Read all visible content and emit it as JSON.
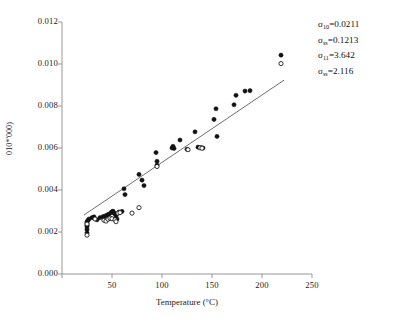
{
  "chart_data": {
    "type": "scatter",
    "title": "",
    "xlabel": "Temperature (°C)",
    "ylabel": "010*'000)",
    "xlim": [
      0,
      250
    ],
    "ylim": [
      0.0,
      0.012
    ],
    "xticks": [
      0,
      50,
      100,
      150,
      200,
      250
    ],
    "xtick_labels": [
      "",
      "50",
      "100",
      "150",
      "200",
      "250"
    ],
    "yticks": [
      0.0,
      0.002,
      0.004,
      0.006,
      0.008,
      0.01,
      0.012
    ],
    "ytick_labels": [
      "0.000",
      "0.002",
      "0.004",
      "0.006",
      "0.008",
      "0.010",
      "0.012"
    ],
    "grid": false,
    "legend": "none",
    "series": [
      {
        "name": "filled",
        "marker": "filled-circle",
        "color": "#111111",
        "points": [
          [
            25,
            0.00248
          ],
          [
            25,
            0.00243
          ],
          [
            25,
            0.00232
          ],
          [
            25,
            0.00225
          ],
          [
            25,
            0.00212
          ],
          [
            25,
            0.00196
          ],
          [
            26,
            0.00256
          ],
          [
            27,
            0.00262
          ],
          [
            30,
            0.00268
          ],
          [
            32,
            0.00272
          ],
          [
            35,
            0.00258
          ],
          [
            38,
            0.00268
          ],
          [
            41,
            0.00273
          ],
          [
            43,
            0.00276
          ],
          [
            45,
            0.00281
          ],
          [
            47,
            0.00285
          ],
          [
            49,
            0.00292
          ],
          [
            50,
            0.00296
          ],
          [
            51,
            0.00299
          ],
          [
            52,
            0.00291
          ],
          [
            53,
            0.00286
          ],
          [
            54,
            0.00276
          ],
          [
            55,
            0.00262
          ],
          [
            57,
            0.00295
          ],
          [
            60,
            0.00298
          ],
          [
            62,
            0.00406
          ],
          [
            63,
            0.00378
          ],
          [
            77,
            0.00474
          ],
          [
            80,
            0.00447
          ],
          [
            82,
            0.00421
          ],
          [
            94,
            0.00578
          ],
          [
            95,
            0.00537
          ],
          [
            95,
            0.00518
          ],
          [
            110,
            0.006
          ],
          [
            111,
            0.00608
          ],
          [
            112,
            0.00598
          ],
          [
            118,
            0.00638
          ],
          [
            125,
            0.00594
          ],
          [
            133,
            0.00677
          ],
          [
            136,
            0.00604
          ],
          [
            139,
            0.00602
          ],
          [
            141,
            0.006
          ],
          [
            152,
            0.00736
          ],
          [
            154,
            0.00787
          ],
          [
            155,
            0.00655
          ],
          [
            172,
            0.00806
          ],
          [
            174,
            0.00851
          ],
          [
            183,
            0.00871
          ],
          [
            188,
            0.00873
          ],
          [
            219,
            0.01042
          ]
        ]
      },
      {
        "name": "open",
        "marker": "open-circle",
        "color": "#111111",
        "points": [
          [
            25,
            0.00238
          ],
          [
            25,
            0.00185
          ],
          [
            33,
            0.00262
          ],
          [
            42,
            0.00256
          ],
          [
            44,
            0.00252
          ],
          [
            46,
            0.00261
          ],
          [
            48,
            0.00266
          ],
          [
            50,
            0.00263
          ],
          [
            53,
            0.00258
          ],
          [
            54,
            0.00249
          ],
          [
            56,
            0.0029
          ],
          [
            58,
            0.00292
          ],
          [
            70,
            0.0029
          ],
          [
            77,
            0.00316
          ],
          [
            95,
            0.00512
          ],
          [
            126,
            0.00592
          ],
          [
            138,
            0.00601
          ],
          [
            140,
            0.00599
          ],
          [
            219,
            0.01002
          ]
        ]
      }
    ],
    "trendline": {
      "name": "linear-fit",
      "color": "#555555",
      "x_start": 22,
      "y_start": 0.00281,
      "x_end": 222,
      "y_end": 0.00923
    },
    "annotations": [
      {
        "symbol": "σ",
        "subscript": "10",
        "equals": "=",
        "value": "0.0211"
      },
      {
        "symbol": "σ",
        "subscript": "ss",
        "equals": "=",
        "value": "0.1213"
      },
      {
        "symbol": "σ",
        "subscript": "11",
        "equals": "=",
        "value": "3.642"
      },
      {
        "symbol": "σ",
        "subscript": "ss",
        "equals": "=",
        "value": "2.116"
      }
    ]
  },
  "colors": {
    "axis": "#8c8c8c",
    "marker": "#111111",
    "trendline": "#555555",
    "text": "#1a1a1a"
  }
}
